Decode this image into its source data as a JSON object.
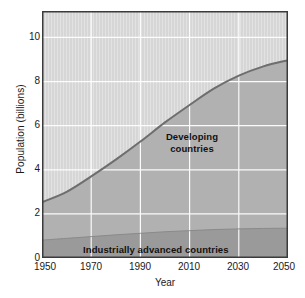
{
  "chart_data": {
    "type": "area",
    "title": "",
    "subtitle": "",
    "xlabel": "Year",
    "ylabel": "Population (billions)",
    "xlim": [
      1950,
      2050
    ],
    "ylim": [
      0,
      11.2
    ],
    "xticks": [
      1950,
      1970,
      1990,
      2010,
      2030,
      2050
    ],
    "xtick_labels": [
      "1950",
      "1970",
      "1990",
      "2010",
      "2030",
      "2050"
    ],
    "yticks": [
      0,
      2,
      4,
      6,
      8,
      10
    ],
    "ytick_labels": [
      "0",
      "2",
      "4",
      "6",
      "8",
      "10"
    ],
    "grid": true,
    "grid_color": "#ffffff",
    "legend_position": "inline-annotations",
    "stacked": true,
    "x": [
      1950,
      1960,
      1970,
      1980,
      1990,
      2000,
      2010,
      2020,
      2030,
      2040,
      2050
    ],
    "series": [
      {
        "name": "Industrially advanced countries",
        "label": "Industrially advanced countries",
        "color": "#9a9a9a",
        "values": [
          0.81,
          0.89,
          0.97,
          1.05,
          1.12,
          1.19,
          1.24,
          1.29,
          1.32,
          1.34,
          1.35
        ]
      },
      {
        "name": "Developing countries",
        "label": "Developing countries",
        "color": "#b1b1b1",
        "values": [
          1.72,
          2.11,
          2.73,
          3.41,
          4.16,
          4.96,
          5.7,
          6.4,
          6.95,
          7.35,
          7.62
        ]
      }
    ],
    "total_series": {
      "name": "World population",
      "color": "#6e6e6e",
      "values": [
        2.53,
        3.0,
        3.7,
        4.46,
        5.28,
        6.15,
        6.94,
        7.69,
        8.27,
        8.69,
        8.97
      ]
    },
    "annotations": [
      {
        "name": "developing-countries-label",
        "text": "Developing\ncountries",
        "x": 2022,
        "y": 5.6
      },
      {
        "name": "industrially-advanced-label",
        "text": "Industrially advanced countries",
        "x": 1998,
        "y": 0.45
      }
    ],
    "plot_background": "#d6d6d6",
    "frame_color": "#3b3b3b"
  },
  "annotations": {
    "developing": "Developing\ncountries",
    "developing_line1": "Developing",
    "developing_line2": "countries",
    "industrial": "Industrially advanced countries"
  },
  "axes": {
    "xlabel": "Year",
    "ylabel": "Population (billions)",
    "xtick_labels": [
      "1950",
      "1970",
      "1990",
      "2010",
      "2030",
      "2050"
    ],
    "ytick_labels": [
      "0",
      "2",
      "4",
      "6",
      "8",
      "10"
    ]
  },
  "colors": {
    "plot_background": "#d6d6d6",
    "developing_fill": "#b1b1b1",
    "industrial_fill": "#9a9a9a",
    "curve": "#6e6e6e",
    "grid": "#ffffff",
    "frame": "#3b3b3b",
    "text": "#1a1a1a"
  }
}
